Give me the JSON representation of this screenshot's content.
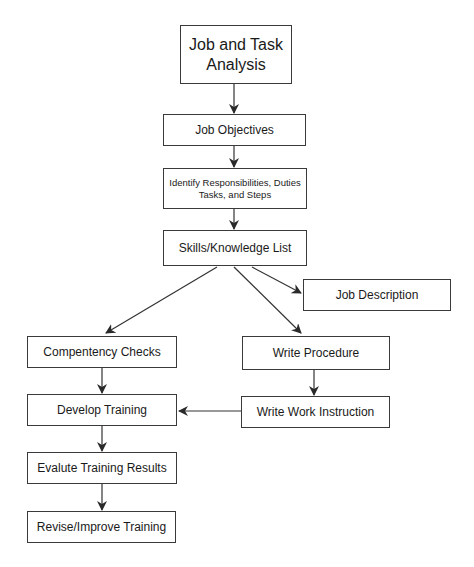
{
  "diagram": {
    "type": "flowchart",
    "nodes": [
      {
        "id": "job-task-analysis",
        "label": "Job and Task Analysis",
        "line1": "Job and Task",
        "line2": "Analysis"
      },
      {
        "id": "job-objectives",
        "label": "Job Objectives"
      },
      {
        "id": "identify-responsibilities",
        "label": "Identify Responsibilities, Duties Tasks, and Steps",
        "line1": "Identify Responsibilities, Duties",
        "line2": "Tasks, and Steps"
      },
      {
        "id": "skills-knowledge",
        "label": "Skills/Knowledge List"
      },
      {
        "id": "job-description",
        "label": "Job Description"
      },
      {
        "id": "competency-checks",
        "label": "Compentency Checks"
      },
      {
        "id": "write-procedure",
        "label": "Write Procedure"
      },
      {
        "id": "develop-training",
        "label": "Develop Training"
      },
      {
        "id": "write-work-instruction",
        "label": "Write Work Instruction"
      },
      {
        "id": "evaluate-training",
        "label": "Evalute Training Results"
      },
      {
        "id": "revise-training",
        "label": "Revise/Improve Training"
      }
    ],
    "edges": [
      {
        "from": "job-task-analysis",
        "to": "job-objectives"
      },
      {
        "from": "job-objectives",
        "to": "identify-responsibilities"
      },
      {
        "from": "identify-responsibilities",
        "to": "skills-knowledge"
      },
      {
        "from": "skills-knowledge",
        "to": "competency-checks"
      },
      {
        "from": "skills-knowledge",
        "to": "write-procedure"
      },
      {
        "from": "skills-knowledge",
        "to": "job-description"
      },
      {
        "from": "competency-checks",
        "to": "develop-training"
      },
      {
        "from": "write-procedure",
        "to": "write-work-instruction"
      },
      {
        "from": "write-work-instruction",
        "to": "develop-training"
      },
      {
        "from": "develop-training",
        "to": "evaluate-training"
      },
      {
        "from": "evaluate-training",
        "to": "revise-training"
      }
    ],
    "colors": {
      "line": "#333333",
      "border": "#3a3a3a",
      "background": "#ffffff"
    }
  }
}
